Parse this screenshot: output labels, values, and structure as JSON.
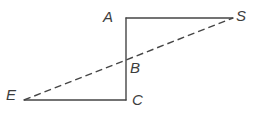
{
  "figure": {
    "kind": "geometry-diagram",
    "background_color": "#ffffff",
    "stroke_color": "#454545",
    "stroke_width": 1.4,
    "label_color": "#3d3d3d",
    "labels": {
      "A": "A",
      "S": "S",
      "B": "B",
      "C": "C",
      "E": "E"
    },
    "points": {
      "A": {
        "x": 126,
        "y": 18
      },
      "S": {
        "x": 233,
        "y": 18
      },
      "B": {
        "x": 126,
        "y": 59
      },
      "C": {
        "x": 126,
        "y": 100
      },
      "E": {
        "x": 24,
        "y": 100
      }
    },
    "segments": [
      {
        "name": "segment-AS",
        "from": "A",
        "to": "S",
        "style": "solid"
      },
      {
        "name": "segment-AC",
        "from": "A",
        "to": "C",
        "style": "solid"
      },
      {
        "name": "segment-CE",
        "from": "C",
        "to": "E",
        "style": "solid"
      },
      {
        "name": "segment-ES",
        "from": "E",
        "to": "S",
        "style": "dashed"
      }
    ],
    "dash_pattern": "7 4"
  }
}
